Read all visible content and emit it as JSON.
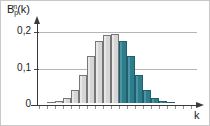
{
  "chart_data": {
    "type": "bar",
    "title": "",
    "subtitle": "",
    "ylabel_parts": {
      "base": "B",
      "superscript": "n",
      "subscript": "p",
      "argument": "(k)"
    },
    "ylabel": "B_p^n(k)",
    "xlabel": "k",
    "ylim": [
      0,
      0.21
    ],
    "yticks": [
      0,
      0.1,
      0.2
    ],
    "ytick_labels": [
      "0",
      "0,1",
      "0,2"
    ],
    "grid": true,
    "grid_axis": "y",
    "legend": "none",
    "decimal_separator": ",",
    "categories": [
      "0",
      "1",
      "2",
      "3",
      "4",
      "5",
      "6",
      "7",
      "8",
      "9",
      "10",
      "11",
      "12",
      "13",
      "14",
      "15",
      "16",
      "17",
      "18"
    ],
    "values": [
      0.0,
      0.002,
      0.005,
      0.012,
      0.034,
      0.071,
      0.12,
      0.16,
      0.174,
      0.176,
      0.16,
      0.12,
      0.071,
      0.034,
      0.012,
      0.005,
      0.002,
      0.0,
      0.0
    ],
    "bar_colors": [
      "gray",
      "gray",
      "gray",
      "gray",
      "gray",
      "gray",
      "gray",
      "gray",
      "gray",
      "gray",
      "teal",
      "teal",
      "teal",
      "teal",
      "teal",
      "teal",
      "teal",
      "teal",
      "teal"
    ],
    "highlight": {
      "color_name": "teal",
      "hex": "#2e7d8d",
      "first_highlighted_index": 10,
      "description": "right tail of the binomial distribution shaded"
    },
    "series": [
      {
        "name": "binomial probability mass",
        "values": [
          0.0,
          0.002,
          0.005,
          0.012,
          0.034,
          0.071,
          0.12,
          0.16,
          0.174,
          0.176,
          0.16,
          0.12,
          0.071,
          0.034,
          0.012,
          0.005,
          0.002,
          0.0,
          0.0
        ]
      }
    ],
    "xtick_count": 19,
    "axis_arrows": {
      "x": true,
      "y": true
    }
  },
  "colors": {
    "bar_gray_fill": "#d6d6d6",
    "bar_gray_border": "#767676",
    "bar_teal_fill": "#2e7d8d",
    "bar_teal_border": "#20606d",
    "gridline": "#b5b5b5",
    "axis": "#3a3a3a",
    "text": "#1a1a1a",
    "frame": "#c8c8c8",
    "background": "#ffffff"
  }
}
